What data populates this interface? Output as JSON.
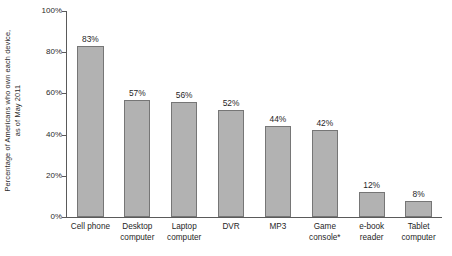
{
  "chart_data": {
    "type": "bar",
    "title": "",
    "subtitle": "",
    "xlabel": "",
    "ylabel": "Percentage of Americans who own each device, as of May 2011",
    "ylabel_lines": [
      "Percentage of Americans who own each device,",
      "as of May 2011"
    ],
    "categories": [
      "Cell phone",
      "Desktop computer",
      "Laptop computer",
      "DVR",
      "MP3",
      "Game console*",
      "e-book reader",
      "Tablet computer"
    ],
    "category_lines": [
      [
        "Cell phone"
      ],
      [
        "Desktop",
        "computer"
      ],
      [
        "Laptop",
        "computer"
      ],
      [
        "DVR"
      ],
      [
        "MP3"
      ],
      [
        "Game",
        "console*"
      ],
      [
        "e-book",
        "reader"
      ],
      [
        "Tablet",
        "computer"
      ]
    ],
    "values": [
      83,
      57,
      56,
      52,
      44,
      42,
      12,
      8
    ],
    "value_labels": [
      "83%",
      "57%",
      "56%",
      "52%",
      "44%",
      "42%",
      "12%",
      "8%"
    ],
    "ylim": [
      0,
      100
    ],
    "yticks": [
      0,
      20,
      40,
      60,
      80,
      100
    ],
    "ytick_labels": [
      "0%",
      "20%",
      "40%",
      "60%",
      "80%",
      "100%"
    ],
    "grid": false,
    "legend": false,
    "legend_position": "none",
    "bar_color": "#b2b2b2",
    "bar_edge_color": "#767676",
    "axis_color": "#5a5a5a",
    "text_color": "#1f1f1f",
    "background": "#ffffff"
  }
}
